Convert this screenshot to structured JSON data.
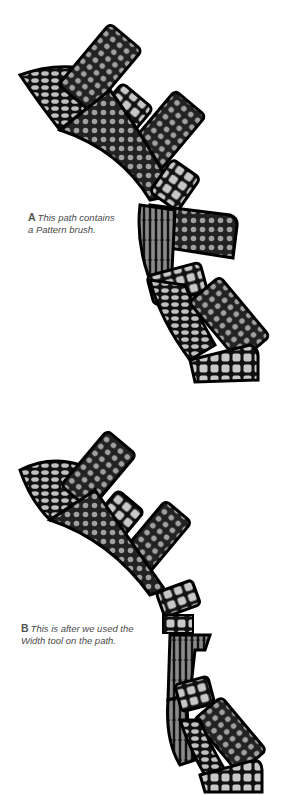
{
  "figure": {
    "panels": [
      {
        "id": "A",
        "letter": "A",
        "caption_line1": "This path contains",
        "caption_line2": "a Pattern brush."
      },
      {
        "id": "B",
        "letter": "B",
        "caption_line1": "This is after we used the",
        "caption_line2": "Width tool on the path."
      }
    ]
  },
  "colors": {
    "outline": "#000000",
    "fill_dark": "#333333",
    "tile_light": "#c8c8c8",
    "tile_mid": "#9a9a9a",
    "caption_text": "#4a4a4a"
  }
}
